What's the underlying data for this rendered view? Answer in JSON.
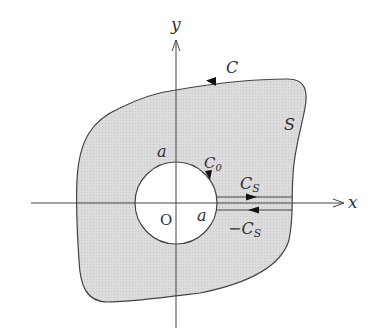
{
  "diagram": {
    "title": "",
    "colors": {
      "region_fill": "#d9d9d9",
      "stroke": "#444444",
      "text": "#333333",
      "hole_fill": "#ffffff"
    },
    "axes": {
      "x_label": "x",
      "y_label": "y",
      "origin_label": "O"
    },
    "region": {
      "label": "S"
    },
    "outer_contour": {
      "label": "C",
      "orientation": "counterclockwise"
    },
    "inner_circle": {
      "label": "C",
      "label_sub": "0",
      "orientation": "counterclockwise",
      "radius_label_top": "a",
      "radius_label_right": "a"
    },
    "cut_segments": {
      "upper_label": "C",
      "upper_label_sub": "S",
      "lower_label_prefix": "−C",
      "lower_label_sub": "S",
      "upper_direction": "right",
      "lower_direction": "left"
    }
  }
}
